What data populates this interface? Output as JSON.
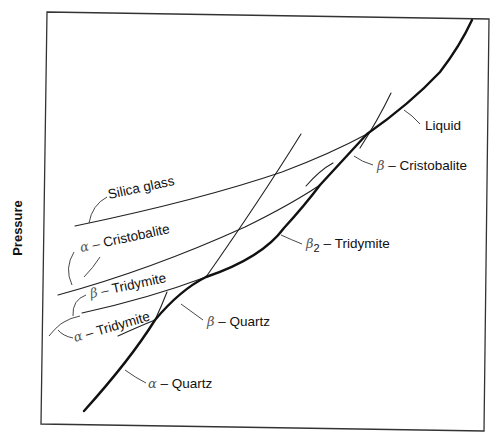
{
  "axes": {
    "y_label": "Pressure",
    "x_label": ""
  },
  "phases": {
    "liquid": {
      "name": "Liquid"
    },
    "beta_cristobalite": {
      "prefix": "β",
      "sep": " – ",
      "name": "Cristobalite"
    },
    "beta2_tridymite": {
      "prefix": "β",
      "sub": "2",
      "sep": " – ",
      "name": "Tridymite"
    },
    "beta_quartz": {
      "prefix": "β",
      "sep": " – ",
      "name": "Quartz"
    },
    "alpha_quartz": {
      "prefix": "α",
      "sep": " – ",
      "name": "Quartz"
    },
    "silica_glass": {
      "name": "Silica glass"
    },
    "alpha_cristobalite": {
      "prefix": "α",
      "sep": " – ",
      "name": "Cristobalite"
    },
    "beta_tridymite": {
      "prefix": "β",
      "sep": " – ",
      "name": "Tridymite"
    },
    "alpha_tridymite": {
      "prefix": "α",
      "sep": " – ",
      "name": "Tridymite"
    }
  }
}
